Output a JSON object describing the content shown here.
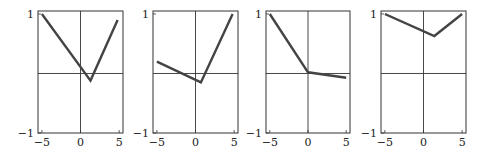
{
  "chart_data": [
    {
      "type": "line",
      "title": "",
      "xlabel": "",
      "ylabel": "",
      "xlim": [
        -5.5,
        5.5
      ],
      "ylim": [
        -1,
        1.05
      ],
      "xticks": [
        -5,
        0,
        5
      ],
      "yticks": [
        -1,
        1
      ],
      "x": [
        -5,
        1.3,
        4.8
      ],
      "y": [
        1.0,
        -0.12,
        0.9
      ],
      "grid": false
    },
    {
      "type": "line",
      "title": "",
      "xlabel": "",
      "ylabel": "",
      "xlim": [
        -5.5,
        5.5
      ],
      "ylim": [
        -1,
        1.05
      ],
      "xticks": [
        -5,
        0,
        5
      ],
      "yticks": [
        -1,
        1
      ],
      "x": [
        -5,
        0.7,
        4.8
      ],
      "y": [
        0.2,
        -0.15,
        1.0
      ],
      "grid": false
    },
    {
      "type": "line",
      "title": "",
      "xlabel": "",
      "ylabel": "",
      "xlim": [
        -5.5,
        5.5
      ],
      "ylim": [
        -1,
        1.05
      ],
      "xticks": [
        -5,
        0,
        5
      ],
      "yticks": [
        -1,
        1
      ],
      "x": [
        -5,
        0,
        5
      ],
      "y": [
        1.0,
        0.02,
        -0.07
      ],
      "grid": false
    },
    {
      "type": "line",
      "title": "",
      "xlabel": "",
      "ylabel": "",
      "xlim": [
        -5.5,
        5.5
      ],
      "ylim": [
        -1,
        1.05
      ],
      "xticks": [
        -5,
        0,
        5
      ],
      "yticks": [
        -1,
        1
      ],
      "x": [
        -5,
        1.4,
        5
      ],
      "y": [
        1.0,
        0.63,
        1.0
      ],
      "grid": false
    }
  ],
  "panels": [
    {
      "left": 38,
      "right": 123
    },
    {
      "left": 153,
      "right": 238
    },
    {
      "left": 266,
      "right": 350
    },
    {
      "left": 381,
      "right": 466
    }
  ],
  "frame": {
    "top": 11,
    "bottom": 133
  },
  "colors": {
    "line": "#444444",
    "axes": "#333333",
    "frame": "#333333"
  },
  "tick_labels": {
    "x": [
      "−5",
      "0",
      "5"
    ],
    "y_top": "1",
    "y_bottom": "−1"
  }
}
